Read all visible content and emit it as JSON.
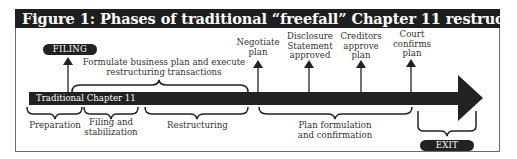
{
  "figure": {
    "title": "Figure 1: Phases of traditional “freefall” Chapter 11 restructuring",
    "timeline_label": "Traditional Chapter 11"
  },
  "markers": {
    "filing": "FILING",
    "exit": "EXIT"
  },
  "milestones": [
    {
      "line1": "Negotiate",
      "line2": "plan",
      "line3": ""
    },
    {
      "line1": "Disclosure",
      "line2": "Statement",
      "line3": "approved"
    },
    {
      "line1": "Creditors",
      "line2": "approve",
      "line3": "plan"
    },
    {
      "line1": "Court",
      "line2": "confirms",
      "line3": "plan"
    }
  ],
  "top_span": {
    "line1": "Formulate business plan and execute",
    "line2": "restructuring transactions"
  },
  "phases": [
    {
      "line1": "Preparation",
      "line2": ""
    },
    {
      "line1": "Filing and",
      "line2": "stabilization"
    },
    {
      "line1": "Restructuring",
      "line2": ""
    },
    {
      "line1": "Plan formulation",
      "line2": "and confirmation"
    }
  ],
  "colors": {
    "title_bg": "#1e1e1e",
    "arrow": "#222222",
    "text": "#333333"
  }
}
